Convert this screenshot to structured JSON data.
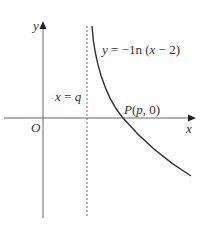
{
  "diagram": {
    "type": "function-graph",
    "axes": {
      "x_label": "x",
      "y_label": "y",
      "origin_label": "O"
    },
    "curve": {
      "equation": "y = −1n (x − 2)",
      "eq_y": "y",
      "eq_rest": " = −1n (",
      "eq_x": "x",
      "eq_end": " − 2)"
    },
    "asymptote": {
      "label_var": "x",
      "label_eq": " = ",
      "label_val": "q",
      "style": "dashed"
    },
    "point": {
      "label_P": "P",
      "label_open": "(",
      "label_p": "p",
      "label_close": ", 0)"
    },
    "colors": {
      "stroke": "#333333",
      "axis": "#555555",
      "background": "#ffffff"
    }
  }
}
